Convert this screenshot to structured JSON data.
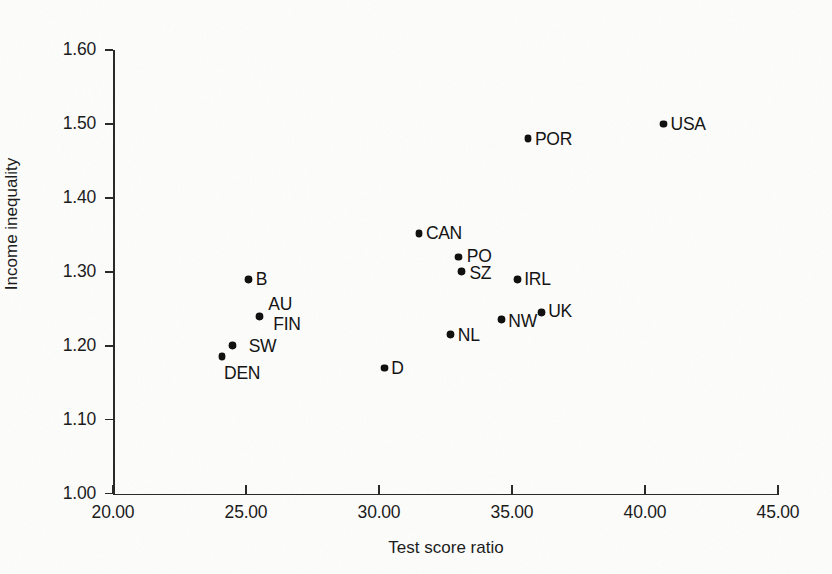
{
  "chart_data": {
    "type": "scatter",
    "title": "",
    "xlabel": "Test score ratio",
    "ylabel": "Income inequality",
    "xlim": [
      20.0,
      45.0
    ],
    "ylim": [
      1.0,
      1.6
    ],
    "xticks": [
      "20.00",
      "25.00",
      "30.00",
      "35.00",
      "40.00",
      "45.00"
    ],
    "xtick_values": [
      20.0,
      25.0,
      30.0,
      35.0,
      40.0,
      45.0
    ],
    "yticks": [
      "1.00",
      "1.10",
      "1.20",
      "1.30",
      "1.40",
      "1.50",
      "1.60"
    ],
    "ytick_values": [
      1.0,
      1.1,
      1.2,
      1.3,
      1.4,
      1.5,
      1.6
    ],
    "grid": false,
    "legend": "none",
    "marker_color": "#111111",
    "axis_color": "#2a2a2a",
    "points": [
      {
        "label": "DEN",
        "x": 24.1,
        "y": 1.185,
        "label_dx": 2,
        "label_dy": 6
      },
      {
        "label": "SW",
        "x": 24.5,
        "y": 1.2,
        "label_dx": 16,
        "label_dy": -10
      },
      {
        "label": "B",
        "x": 25.1,
        "y": 1.29,
        "label_dx": 7,
        "label_dy": -10
      },
      {
        "label": "AU",
        "x": 25.5,
        "y": 1.24,
        "label_dx": 9,
        "label_dy": -22
      },
      {
        "label": "FIN",
        "x": 25.5,
        "y": 1.24,
        "label_dx": 14,
        "label_dy": -2
      },
      {
        "label": "D",
        "x": 30.2,
        "y": 1.17,
        "label_dx": 7,
        "label_dy": -10
      },
      {
        "label": "CAN",
        "x": 31.5,
        "y": 1.352,
        "label_dx": 7,
        "label_dy": -10
      },
      {
        "label": "NL",
        "x": 32.7,
        "y": 1.215,
        "label_dx": 7,
        "label_dy": -10
      },
      {
        "label": "PO",
        "x": 33.0,
        "y": 1.32,
        "label_dx": 8,
        "label_dy": -11
      },
      {
        "label": "SZ",
        "x": 33.1,
        "y": 1.3,
        "label_dx": 8,
        "label_dy": -9
      },
      {
        "label": "NW",
        "x": 34.6,
        "y": 1.235,
        "label_dx": 7,
        "label_dy": -9
      },
      {
        "label": "IRL",
        "x": 35.2,
        "y": 1.29,
        "label_dx": 7,
        "label_dy": -10
      },
      {
        "label": "POR",
        "x": 35.6,
        "y": 1.48,
        "label_dx": 7,
        "label_dy": -10
      },
      {
        "label": "UK",
        "x": 36.1,
        "y": 1.245,
        "label_dx": 7,
        "label_dy": -11
      },
      {
        "label": "USA",
        "x": 40.7,
        "y": 1.5,
        "label_dx": 7,
        "label_dy": -10
      }
    ]
  }
}
